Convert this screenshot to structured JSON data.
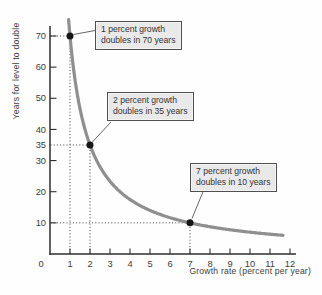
{
  "chart_data": {
    "type": "line",
    "title": "",
    "xlabel": "Growth rate (percent per year)",
    "ylabel": "Years for level to double",
    "xlim": [
      0,
      12.3
    ],
    "ylim": [
      0,
      78
    ],
    "grid": false,
    "legend": "none",
    "x_ticks": [
      0,
      1,
      2,
      3,
      4,
      5,
      6,
      7,
      8,
      9,
      10,
      11,
      12
    ],
    "y_ticks": [
      10,
      20,
      30,
      35,
      40,
      50,
      60,
      70
    ],
    "y_ticks_unmarked": [
      35
    ],
    "curve": {
      "name": "doubling-time curve",
      "formula": "years = 70 / growth rate",
      "x_start": 0.93,
      "x_end": 11.65
    },
    "series": [
      {
        "name": "Years to double (70 / growth rate)",
        "x": [
          1,
          2,
          3,
          4,
          5,
          6,
          7,
          8,
          9,
          10,
          11,
          12
        ],
        "values": [
          70,
          35,
          23.3,
          17.5,
          14,
          11.7,
          10,
          8.8,
          7.8,
          7,
          6.4,
          5.8
        ]
      }
    ],
    "points": [
      {
        "x": 1,
        "y": 70
      },
      {
        "x": 2,
        "y": 35
      },
      {
        "x": 7,
        "y": 10
      }
    ],
    "annotations": [
      {
        "line1": "1 percent growth",
        "line2": "doubles in 70 years",
        "target": {
          "x": 1,
          "y": 70
        }
      },
      {
        "line1": "2 percent growth",
        "line2": "doubles in 35 years",
        "target": {
          "x": 2,
          "y": 35
        }
      },
      {
        "line1": "7 percent growth",
        "line2": "doubles in 10 years",
        "target": {
          "x": 7,
          "y": 10
        }
      }
    ],
    "colors": {
      "curve": "#8f8f8f",
      "dot": "#161616",
      "axis": "#2e2e2e",
      "text": "#3c3c3c",
      "guide": "#3a3a3a",
      "leader": "#555555",
      "callout_bg": "#e9e9e9",
      "callout_border": "#4f4f4f"
    }
  }
}
